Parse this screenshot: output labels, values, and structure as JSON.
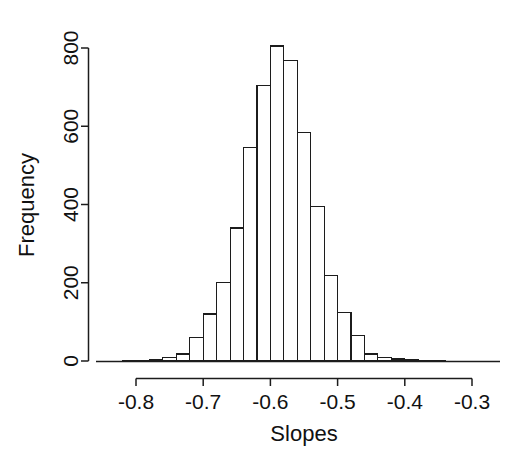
{
  "figure": {
    "width": 520,
    "height": 468,
    "background": "#ffffff",
    "foreground": "#1c1c1c"
  },
  "chart_data": {
    "type": "bar",
    "title": "",
    "subtitle": "",
    "xlabel": "Slopes",
    "ylabel": "Frequency",
    "xlim": [
      -0.83,
      -0.29
    ],
    "ylim": [
      0,
      820
    ],
    "xticks": [
      -0.8,
      -0.7,
      -0.6,
      -0.5,
      -0.4,
      -0.3
    ],
    "xtick_labels": [
      "-0.8",
      "-0.7",
      "-0.6",
      "-0.5",
      "-0.4",
      "-0.3"
    ],
    "yticks": [
      0,
      200,
      400,
      600,
      800
    ],
    "ytick_labels": [
      "0",
      "200",
      "400",
      "600",
      "800"
    ],
    "grid": false,
    "legend": "none",
    "bin_width": 0.02,
    "bin_edges": [
      -0.82,
      -0.8,
      -0.78,
      -0.76,
      -0.74,
      -0.72,
      -0.7,
      -0.68,
      -0.66,
      -0.64,
      -0.62,
      -0.6,
      -0.58,
      -0.56,
      -0.54,
      -0.52,
      -0.5,
      -0.48,
      -0.46,
      -0.44,
      -0.42,
      -0.4,
      -0.38,
      -0.36,
      -0.34
    ],
    "bin_centers": [
      -0.81,
      -0.79,
      -0.77,
      -0.75,
      -0.73,
      -0.71,
      -0.69,
      -0.67,
      -0.65,
      -0.63,
      -0.61,
      -0.59,
      -0.57,
      -0.55,
      -0.53,
      -0.51,
      -0.49,
      -0.47,
      -0.45,
      -0.43,
      -0.41,
      -0.39,
      -0.37,
      -0.35
    ],
    "values": [
      1,
      2,
      4,
      8,
      18,
      60,
      120,
      200,
      340,
      545,
      705,
      805,
      768,
      585,
      395,
      218,
      125,
      65,
      18,
      10,
      5,
      3,
      2,
      1
    ],
    "categories": [
      "-0.81",
      "-0.79",
      "-0.77",
      "-0.75",
      "-0.73",
      "-0.71",
      "-0.69",
      "-0.67",
      "-0.65",
      "-0.63",
      "-0.61",
      "-0.59",
      "-0.57",
      "-0.55",
      "-0.53",
      "-0.51",
      "-0.49",
      "-0.47",
      "-0.45",
      "-0.43",
      "-0.41",
      "-0.39",
      "-0.37",
      "-0.35"
    ],
    "bar_style": {
      "fill": "#ffffff",
      "edge": "#1c1c1c"
    }
  },
  "axes": {
    "x_title": "Slopes",
    "y_title": "Frequency"
  }
}
